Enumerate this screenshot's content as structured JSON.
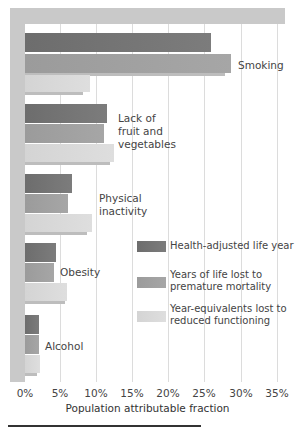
{
  "chart_data": {
    "type": "bar",
    "orientation": "horizontal",
    "title": "",
    "xlabel": "Population attributable fraction",
    "ylabel": "",
    "xlim": [
      0,
      35
    ],
    "xticks": [
      "0%",
      "5%",
      "10%",
      "15%",
      "20%",
      "25%",
      "30%",
      "35%"
    ],
    "grid": true,
    "legend_position": "lower right (inside plot)",
    "categories": [
      "Smoking",
      "Lack of fruit and vegetables",
      "Physical inactivity",
      "Obesity",
      "Alcohol"
    ],
    "series": [
      {
        "name": "Health-adjusted life year",
        "color": "#747474",
        "values": [
          25.8,
          11.4,
          6.5,
          4.3,
          2.0
        ]
      },
      {
        "name": "Years of life lost to premature mortality",
        "color": "#a0a0a0",
        "values": [
          28.6,
          11.0,
          6.0,
          4.0,
          2.0
        ]
      },
      {
        "name": "Year-equivalents lost to reduced functioning",
        "color": "#d8d8d8",
        "values": [
          9.0,
          12.4,
          9.3,
          5.8,
          2.1
        ]
      }
    ]
  },
  "labels": {
    "smoking": "Smoking",
    "fruit": "Lack of\nfruit and\nvegetables",
    "inactivity": "Physical\ninactivity",
    "obesity": "Obesity",
    "alcohol": "Alcohol"
  },
  "legend": {
    "hly": "Health-adjusted life year",
    "yll": "Years of life lost to\npremature mortality",
    "yld": "Year-equivalents lost to\nreduced functioning"
  },
  "axis": {
    "ticks": [
      "0%",
      "5%",
      "10%",
      "15%",
      "20%",
      "25%",
      "30%",
      "35%"
    ],
    "title": "Population attributable fraction"
  }
}
